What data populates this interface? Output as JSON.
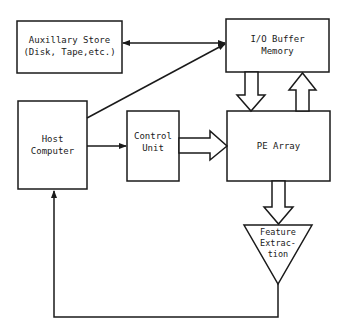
{
  "diagram": {
    "nodes": {
      "aux_store": {
        "line1": "Auxillary Store",
        "line2": "(Disk, Tape,etc.)"
      },
      "io_buffer": {
        "line1": "I/O Buffer",
        "line2": "Memory"
      },
      "host": {
        "line1": "Host",
        "line2": "Computer"
      },
      "control_unit": {
        "line1": "Control",
        "line2": "Unit"
      },
      "pe_array": {
        "line1": "PE Array"
      },
      "feature_extraction": {
        "line1": "Feature",
        "line2": "Extrac-",
        "line3": "tion"
      }
    },
    "edges": [
      {
        "from": "io_buffer",
        "to": "aux_store",
        "type": "bidirectional"
      },
      {
        "from": "host",
        "to": "io_buffer",
        "type": "line-arrow"
      },
      {
        "from": "host",
        "to": "control_unit",
        "type": "arrow"
      },
      {
        "from": "control_unit",
        "to": "pe_array",
        "type": "block-arrow"
      },
      {
        "from": "io_buffer",
        "to": "pe_array",
        "type": "block-arrow"
      },
      {
        "from": "pe_array",
        "to": "io_buffer",
        "type": "block-arrow"
      },
      {
        "from": "pe_array",
        "to": "feature_extraction",
        "type": "block-arrow"
      },
      {
        "from": "feature_extraction",
        "to": "host",
        "type": "feedback-arrow"
      }
    ],
    "line_color": "#1a1a1a"
  }
}
